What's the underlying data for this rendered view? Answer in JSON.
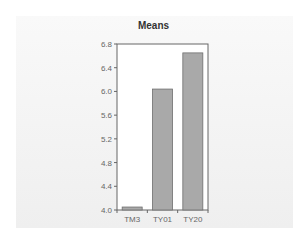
{
  "chart_data": {
    "type": "bar",
    "title": "Means",
    "categories": [
      "TM3",
      "TY01",
      "TY20"
    ],
    "values": [
      4.05,
      6.04,
      6.65
    ],
    "xlabel": "",
    "ylabel": "",
    "ylim": [
      4.0,
      6.8
    ],
    "yticks": [
      "4.0",
      "4.4",
      "4.8",
      "5.2",
      "5.6",
      "6.0",
      "6.4",
      "6.8"
    ],
    "grid": false,
    "legend": null,
    "bar_color": "#a9a9a9",
    "bar_edge_color": "#6e6e6e"
  }
}
